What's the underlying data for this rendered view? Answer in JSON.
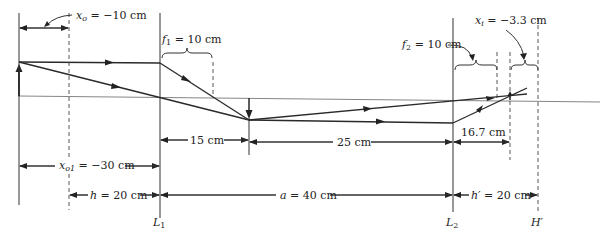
{
  "labels": {
    "xo": "x",
    "xo_sub": "o",
    "xo_val": " = −10 cm",
    "f1": "f",
    "f1_sub": "1",
    "f1_val": " = 10 cm",
    "f2": "f",
    "f2_sub": "2",
    "f2_val": " = 10 cm",
    "xi": "x",
    "xi_sub": "i",
    "xi_val": " = −3.3 cm",
    "d15": "15 cm",
    "d25": "25 cm",
    "d167": "16.7 cm",
    "xo1": "x",
    "xo1_sub": "o1",
    "xo1_val": " = −30 cm",
    "h": "h",
    "h_val": " = 20 cm",
    "a": "a",
    "a_val": " = 40 cm",
    "hp": "h′",
    "hp_val": " = 20 cm",
    "L1": "L",
    "L1_sub": "1",
    "L2": "L",
    "L2_sub": "2",
    "Hp": "H′"
  }
}
